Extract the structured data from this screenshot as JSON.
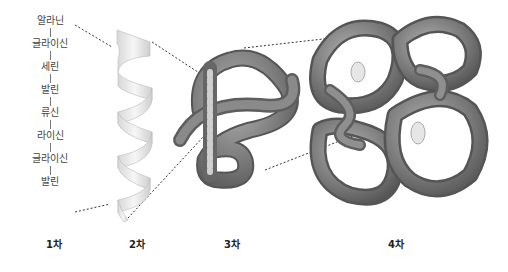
{
  "diagram": {
    "primary_sequence": [
      "알라닌",
      "글라이신",
      "세린",
      "발린",
      "류신",
      "라이신",
      "글라이신",
      "발린"
    ],
    "level_labels": [
      "1차",
      "2차",
      "3차",
      "4차"
    ],
    "colors": {
      "helix": "#e8e8e8",
      "tube": "#7a7a7a",
      "tube_highlight": "#a9a9a9",
      "connector": "#333333"
    }
  }
}
